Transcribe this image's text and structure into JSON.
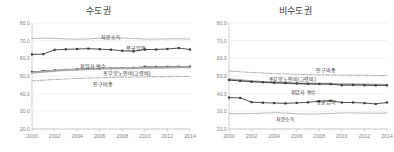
{
  "chart_data": [
    {
      "type": "line",
      "title": "수도권",
      "xlabel": "",
      "ylabel": "",
      "x": [
        2000,
        2001,
        2002,
        2003,
        2004,
        2005,
        2006,
        2007,
        2008,
        2009,
        2010,
        2011,
        2012,
        2013,
        2014
      ],
      "xticks": [
        2000,
        2002,
        2004,
        2006,
        2008,
        2010,
        2012,
        2014
      ],
      "yticks": [
        "80.0",
        "70.0",
        "60.0",
        "50.0",
        "40.0",
        "30.0",
        "20.0"
      ],
      "ylim": [
        20.0,
        80.0
      ],
      "grid": true,
      "legend": "inline-annotations",
      "series": [
        {
          "name": "처분소득",
          "style": "thin-solid-gray",
          "values": [
            71.2,
            71.4,
            71.3,
            71.0,
            70.8,
            71.0,
            71.4,
            71.6,
            71.5,
            71.2,
            70.9,
            70.9,
            71.0,
            71.1,
            70.9
          ]
        },
        {
          "name": "평균임여",
          "style": "marker-solid-dark",
          "values": [
            62.2,
            62.4,
            64.8,
            65.1,
            65.3,
            65.5,
            65.2,
            64.9,
            64.3,
            64.0,
            65.0,
            65.0,
            65.3,
            65.8,
            65.0
          ]
        },
        {
          "name": "취업자 변수",
          "style": "marker-solid-dark",
          "values": [
            52.3,
            52.8,
            53.2,
            53.5,
            53.8,
            54.0,
            54.2,
            54.4,
            54.5,
            54.6,
            55.2,
            55.1,
            55.2,
            55.3,
            55.3
          ]
        },
        {
          "name": "총부양노인비(고령비)",
          "style": "thick-solid-gray",
          "values": [
            51.8,
            52.4,
            53.0,
            53.4,
            53.7,
            54.0,
            54.2,
            54.4,
            54.4,
            54.4,
            54.6,
            54.7,
            54.8,
            54.9,
            55.0
          ]
        },
        {
          "name": "인구비중",
          "style": "dash-dot-gray",
          "values": [
            47.2,
            47.6,
            48.0,
            48.3,
            48.6,
            48.8,
            49.0,
            49.2,
            49.3,
            49.4,
            49.5,
            49.6,
            49.6,
            49.7,
            49.7
          ]
        }
      ],
      "annotations": [
        {
          "text": "처분소득",
          "x": 2007.0,
          "y": 72.6
        },
        {
          "text": "평균임여",
          "x": 2009.2,
          "y": 66.6
        },
        {
          "text": "취업자 변수",
          "x": 2005.4,
          "y": 56.3
        },
        {
          "text": "총부양노인비(고령비)",
          "x": 2008.4,
          "y": 52.4
        },
        {
          "text": "인구비중",
          "x": 2006.3,
          "y": 46.0
        }
      ]
    },
    {
      "type": "line",
      "title": "비수도권",
      "xlabel": "",
      "ylabel": "",
      "x": [
        2000,
        2001,
        2002,
        2003,
        2004,
        2005,
        2006,
        2007,
        2008,
        2009,
        2010,
        2011,
        2012,
        2013,
        2014
      ],
      "xticks": [
        2000,
        2002,
        2004,
        2006,
        2008,
        2010,
        2012,
        2014
      ],
      "yticks": [
        "80.0",
        "70.0",
        "60.0",
        "50.0",
        "40.0",
        "30.0",
        "20.0"
      ],
      "ylim": [
        20.0,
        80.0
      ],
      "grid": true,
      "legend": "inline-annotations",
      "series": [
        {
          "name": "인구비중",
          "style": "dash-dot-gray",
          "values": [
            52.8,
            52.4,
            52.0,
            51.7,
            51.4,
            51.2,
            51.0,
            50.8,
            50.7,
            50.6,
            50.5,
            50.4,
            50.4,
            50.3,
            50.3
          ]
        },
        {
          "name": "총부양노인비(고령비)",
          "style": "thick-solid-gray",
          "values": [
            48.2,
            47.6,
            47.0,
            46.6,
            46.3,
            46.0,
            45.8,
            45.6,
            45.6,
            45.6,
            45.4,
            45.3,
            45.2,
            45.1,
            45.0
          ]
        },
        {
          "name": "취업자 변수",
          "style": "marker-solid-dark",
          "values": [
            47.7,
            47.2,
            46.8,
            46.5,
            46.2,
            46.0,
            45.8,
            45.6,
            45.5,
            45.4,
            44.8,
            44.9,
            44.8,
            44.7,
            44.7
          ]
        },
        {
          "name": "평균임여",
          "style": "marker-solid-dark",
          "values": [
            37.8,
            37.6,
            35.2,
            34.9,
            34.7,
            34.5,
            34.8,
            35.1,
            35.7,
            36.0,
            35.0,
            35.0,
            34.7,
            34.2,
            35.0
          ]
        },
        {
          "name": "처분소득",
          "style": "thin-solid-gray",
          "values": [
            28.8,
            28.6,
            28.7,
            29.0,
            29.2,
            29.0,
            28.6,
            28.4,
            28.5,
            28.8,
            29.1,
            29.1,
            29.0,
            28.9,
            29.1
          ]
        }
      ],
      "annotations": [
        {
          "text": "인구비중",
          "x": 2008.6,
          "y": 53.8
        },
        {
          "text": "총부양노인비(고령비)",
          "x": 2005.6,
          "y": 48.6
        },
        {
          "text": "취업자 변수",
          "x": 2006.6,
          "y": 41.6
        },
        {
          "text": "평균임여",
          "x": 2008.6,
          "y": 35.6
        },
        {
          "text": "처분소득",
          "x": 2005.0,
          "y": 26.4
        }
      ]
    }
  ],
  "colors": {
    "title_text": "#3a3a3a",
    "tick_text": "#7d7d7d",
    "annotation_text": "#2e2e2e",
    "grid": "#e2e2e2",
    "axis": "#b4b4b4",
    "series_dark": "#3c3c3c",
    "series_gray": "#9a9a9a",
    "series_thick_gray": "#a8a8a8",
    "background": "#ffffff"
  }
}
